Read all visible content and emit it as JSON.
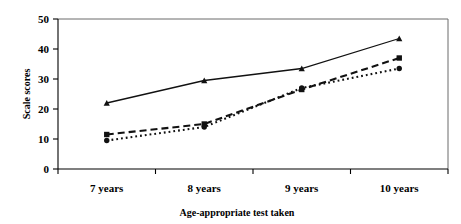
{
  "chart_data": {
    "type": "line",
    "title": "",
    "xlabel": "Age-appropriate test taken",
    "ylabel": "Scale scores",
    "categories": [
      "7 years",
      "8 years",
      "9 years",
      "10 years"
    ],
    "ylim": [
      0,
      50
    ],
    "yticks": [
      0,
      10,
      20,
      30,
      40,
      50
    ],
    "ytick_labels": [
      "0",
      "10",
      "20",
      "30",
      "40",
      "50"
    ],
    "grid": false,
    "legend": "none",
    "series": [
      {
        "name": "series-1",
        "line_style": "solid",
        "marker": "triangle",
        "color": "#111111",
        "values": [
          22,
          29.5,
          33.5,
          43.5
        ]
      },
      {
        "name": "series-2",
        "line_style": "dashed",
        "marker": "square",
        "color": "#111111",
        "values": [
          11.5,
          15,
          26.5,
          37
        ]
      },
      {
        "name": "series-3",
        "line_style": "dotted",
        "marker": "circle",
        "color": "#111111",
        "values": [
          9.5,
          14,
          27,
          33.5
        ]
      }
    ]
  },
  "axis": {
    "y_title": "Scale scores",
    "x_title": "Age-appropriate test taken",
    "y_tick_0": "0",
    "y_tick_1": "10",
    "y_tick_2": "20",
    "y_tick_3": "30",
    "y_tick_4": "40",
    "y_tick_5": "50",
    "x_cat_0": "7 years",
    "x_cat_1": "8 years",
    "x_cat_2": "9 years",
    "x_cat_3": "10 years"
  }
}
